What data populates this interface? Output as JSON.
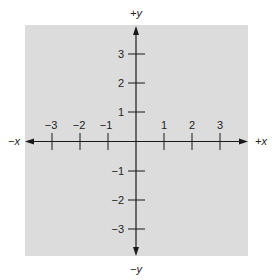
{
  "diagram": {
    "type": "cartesian-coordinate-plane",
    "background_color": "#dcdcdc",
    "axis_color": "#1a1a1a",
    "axis_labels": {
      "pos_x": "+x",
      "neg_x": "−x",
      "pos_y": "+y",
      "neg_y": "−y"
    },
    "x_ticks": [
      {
        "value": -3,
        "label": "−3"
      },
      {
        "value": -2,
        "label": "−2"
      },
      {
        "value": -1,
        "label": "−1"
      },
      {
        "value": 1,
        "label": "1"
      },
      {
        "value": 2,
        "label": "2"
      },
      {
        "value": 3,
        "label": "3"
      }
    ],
    "y_ticks": [
      {
        "value": 3,
        "label": "3"
      },
      {
        "value": 2,
        "label": "2"
      },
      {
        "value": 1,
        "label": "1"
      },
      {
        "value": -1,
        "label": "−1"
      },
      {
        "value": -2,
        "label": "−2"
      },
      {
        "value": -3,
        "label": "−3"
      }
    ]
  }
}
